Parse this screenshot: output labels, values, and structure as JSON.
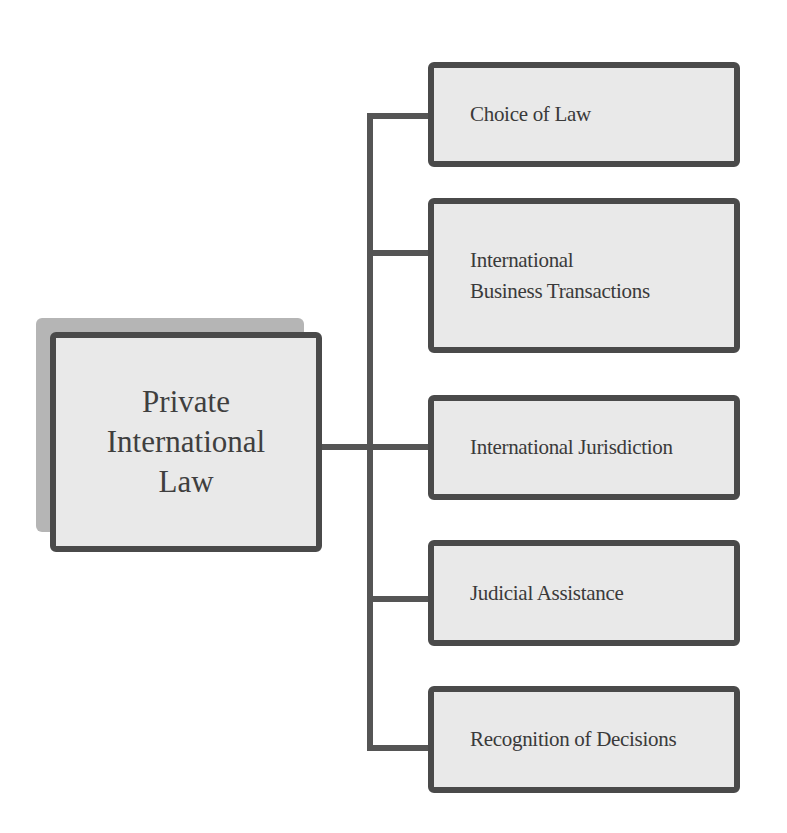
{
  "diagram": {
    "type": "hierarchy-tree",
    "root": {
      "lines": [
        "Private",
        "International",
        "Law"
      ],
      "label": "Private International Law"
    },
    "children": [
      {
        "lines": [
          "Choice of Law"
        ],
        "label": "Choice of Law"
      },
      {
        "lines": [
          "International",
          "Business Transactions"
        ],
        "label": "International Business Transactions"
      },
      {
        "lines": [
          "International Jurisdiction"
        ],
        "label": "International Jurisdiction"
      },
      {
        "lines": [
          "Judicial Assistance"
        ],
        "label": "Judicial Assistance"
      },
      {
        "lines": [
          "Recognition of Decisions"
        ],
        "label": "Recognition of Decisions"
      }
    ],
    "colors": {
      "box_fill": "#e9e9e9",
      "box_border": "#4a4a4a",
      "connector": "#555555",
      "root_shadow": "#b5b5b5",
      "text": "#3a3a3a"
    }
  }
}
